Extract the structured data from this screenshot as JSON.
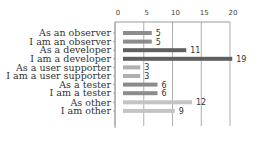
{
  "chart_data": {
    "type": "bar",
    "orientation": "horizontal",
    "title": "",
    "xlabel": "",
    "ylabel": "",
    "xlim": [
      0,
      20
    ],
    "x_ticks": [
      "0",
      "5",
      "10",
      "15",
      "20"
    ],
    "x_tick_values": [
      0,
      5,
      10,
      15,
      20
    ],
    "x_axis_position": "top",
    "grid": true,
    "legend": "none",
    "categories": [
      "As an observer",
      "I am an observer",
      "As a developer",
      "I am a developer",
      "As a user supporter",
      "I am a user supporter",
      "As a tester",
      "I am a tester",
      "As other",
      "I am other"
    ],
    "values": [
      5,
      5,
      11,
      19,
      3,
      3,
      6,
      6,
      12,
      9
    ],
    "data_labels": [
      "5",
      "5",
      "11",
      "19",
      "3",
      "3",
      "6",
      "6",
      "12",
      "9"
    ],
    "bar_colors": [
      "#8c8c8c",
      "#8c8c8c",
      "#606060",
      "#606060",
      "#b0b0b0",
      "#b0b0b0",
      "#8c8c8c",
      "#8c8c8c",
      "#c4c4c4",
      "#c4c4c4"
    ]
  }
}
